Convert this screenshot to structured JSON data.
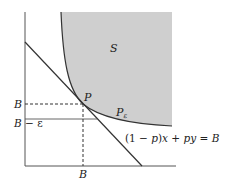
{
  "figure": {
    "region_label": "S",
    "point_label": "P",
    "point_eps_label": "P",
    "point_eps_sub": "ε",
    "equation": {
      "open": "(1 − ",
      "p": "p",
      "mid": ")",
      "x": "x",
      "plus": " + ",
      "py": "py",
      "eq": " = ",
      "B": "B"
    },
    "y_tick_B": "B",
    "y_tick_B_minus_eps": {
      "B": "B",
      "rest": " − ε"
    },
    "x_tick_B": "B"
  },
  "colors": {
    "shade": "#cfcfcf",
    "line": "#333333",
    "axis": "#555555"
  }
}
